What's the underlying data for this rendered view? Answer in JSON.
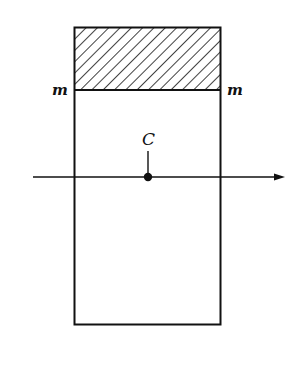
{
  "diagram": {
    "labels": {
      "left_m": "m",
      "right_m": "m",
      "centroid": "C"
    },
    "colors": {
      "stroke": "#111111",
      "background": "#ffffff"
    },
    "elements": {
      "rectangle": "cross-section",
      "hatched_region": "area above line m-m",
      "axis": "horizontal axis through centroid C with arrow pointing right"
    }
  }
}
